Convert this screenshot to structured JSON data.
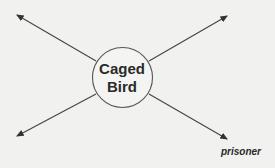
{
  "diagram": {
    "type": "word-web",
    "center": {
      "line1": "Caged",
      "line2": "Bird"
    },
    "branches": [
      {
        "direction": "top-left",
        "label": ""
      },
      {
        "direction": "top-right",
        "label": ""
      },
      {
        "direction": "bottom-left",
        "label": ""
      },
      {
        "direction": "bottom-right",
        "label": "prisoner"
      }
    ],
    "colors": {
      "background": "#f1f1ef",
      "ink": "#2a2a2a"
    }
  }
}
